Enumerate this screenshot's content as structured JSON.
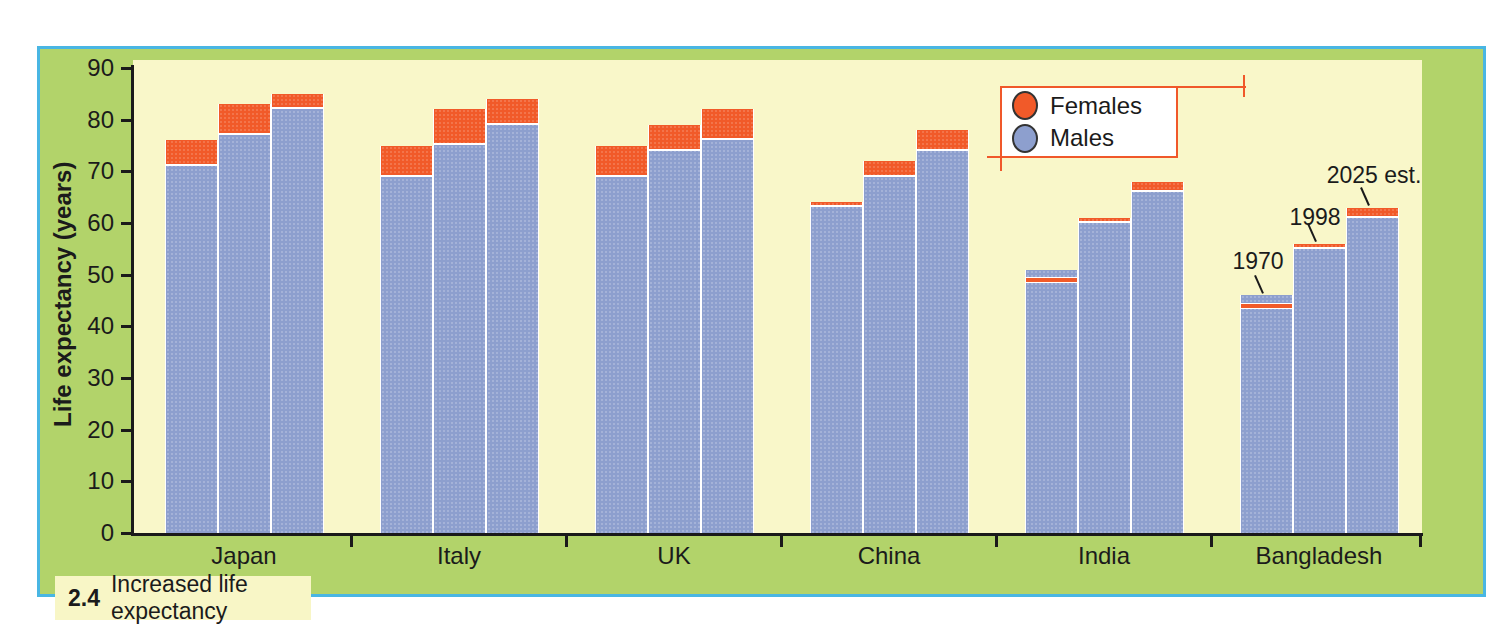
{
  "figure": {
    "caption_number": "2.4",
    "caption_text": "Increased life expectancy"
  },
  "chart_data": {
    "type": "bar",
    "title": "2.4 Increased life expectancy",
    "xlabel": "",
    "ylabel": "Life expectancy (years)",
    "ylim": [
      0,
      90
    ],
    "ytick_labels": [
      "0",
      "10",
      "20",
      "30",
      "40",
      "50",
      "60",
      "70",
      "80",
      "90"
    ],
    "grid": false,
    "categories": [
      "Japan",
      "Italy",
      "UK",
      "China",
      "India",
      "Bangladesh"
    ],
    "bar_years": [
      "1970",
      "1998",
      "2025 est."
    ],
    "series": [
      {
        "name": "Males",
        "color": "#8d9fce",
        "values": [
          [
            71,
            77,
            82
          ],
          [
            69,
            75,
            79
          ],
          [
            69,
            74,
            76
          ],
          [
            63,
            69,
            74
          ],
          [
            51,
            60,
            66
          ],
          [
            46,
            55,
            61
          ]
        ]
      },
      {
        "name": "Females",
        "color": "#f15a29",
        "values": [
          [
            76,
            83,
            85
          ],
          [
            75,
            82,
            84
          ],
          [
            75,
            79,
            82
          ],
          [
            64,
            72,
            78
          ],
          [
            49,
            61,
            68
          ],
          [
            44,
            56,
            63
          ]
        ]
      }
    ],
    "legend": {
      "position": "top-right",
      "items": [
        {
          "label": "Females",
          "color": "#f15a29"
        },
        {
          "label": "Males",
          "color": "#8d9fce"
        }
      ]
    },
    "annotations": [
      {
        "label": "1970",
        "target_category": "Bangladesh",
        "target_bar": 0
      },
      {
        "label": "1998",
        "target_category": "Bangladesh",
        "target_bar": 1
      },
      {
        "label": "2025 est.",
        "target_category": "Bangladesh",
        "target_bar": 2
      }
    ]
  },
  "colors": {
    "page_background": "#ffffff",
    "panel_green": "#b2d36a",
    "panel_border_blue": "#49b6e3",
    "plot_cream": "#f9f7c9",
    "bar_blue": "#8d9fce",
    "bar_orange": "#f15a29",
    "legend_border_red": "#f0582a",
    "axis_black": "#1a1a1a",
    "caption_strip": "#f8f6c6"
  }
}
